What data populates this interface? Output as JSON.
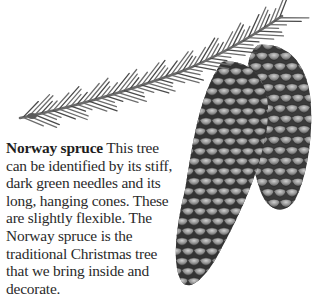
{
  "illustration": {
    "subject": "norway-spruce-branch-with-cones",
    "colors": {
      "needle": "#6d6d6d",
      "needle_dark": "#4a4a4a",
      "cone_base": "#3a3a3a",
      "cone_scale": "#8a8a8a",
      "cone_highlight": "#c4c4c4"
    }
  },
  "caption": {
    "title": "Norway spruce",
    "body": " This tree can be identified by its stiff, dark green needles and its long, hanging cones. These are slightly flexible. The Norway spruce is the traditional Christmas tree that we bring inside and decorate."
  }
}
